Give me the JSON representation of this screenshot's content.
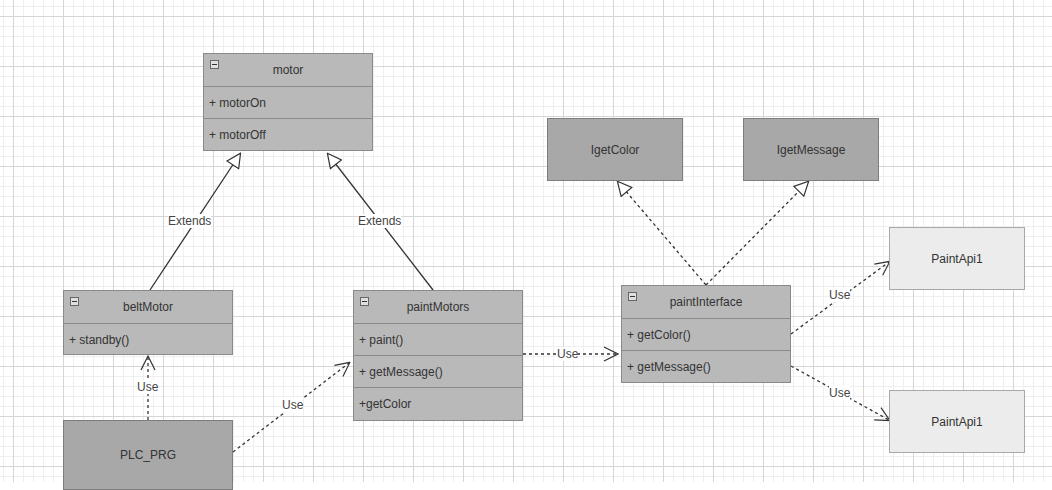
{
  "diagram": {
    "type": "UML class diagram",
    "classes": {
      "motor": {
        "name": "motor",
        "members": [
          "+ motorOn",
          "+ motorOff"
        ]
      },
      "beltMotor": {
        "name": "beltMotor",
        "members": [
          "+ standby()"
        ]
      },
      "paintMotors": {
        "name": "paintMotors",
        "members": [
          "+ paint()",
          "+ getMessage()",
          "+getColor"
        ]
      },
      "paintInterface": {
        "name": "paintInterface",
        "members": [
          "+ getColor()",
          "+ getMessage()"
        ]
      }
    },
    "boxes": {
      "plc_prg": "PLC_PRG",
      "igetcolor": "IgetColor",
      "igetmessage": "IgetMessage",
      "paintapi_top": "PaintApi1",
      "paintapi_bottom": "PaintApi1"
    },
    "edge_labels": {
      "belt_extends": "Extends",
      "paint_extends": "Extends",
      "plc_use_belt": "Use",
      "plc_use_paint": "Use",
      "paint_use_interface": "Use",
      "interface_use_api_top": "Use",
      "interface_use_api_bottom": "Use"
    },
    "colors": {
      "class_fill": "#b9b9b9",
      "interface_fill": "#a8a8a8",
      "api_fill": "#ececec",
      "line": "#333333"
    }
  }
}
